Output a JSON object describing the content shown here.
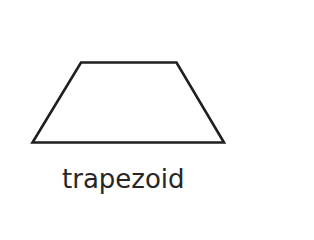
{
  "figure": {
    "shape_name": "trapezoid",
    "label": "trapezoid",
    "stroke_color": "#1f1f1f",
    "fill_color": "#ffffff",
    "vertices": [
      [
        81,
        62.5
      ],
      [
        176.5,
        62.5
      ],
      [
        224,
        142.5
      ],
      [
        32.5,
        142.5
      ]
    ]
  }
}
